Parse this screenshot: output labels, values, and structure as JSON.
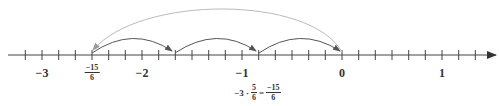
{
  "chart_data": {
    "type": "number-line",
    "title": "",
    "axis": {
      "min": -3.1667,
      "max": 1.3333,
      "tick_step": "1/6",
      "direction_arrow": "right"
    },
    "labels": [
      {
        "value": -3,
        "text": "−3"
      },
      {
        "value": -2.5,
        "text_num": "−15",
        "text_den": "6"
      },
      {
        "value": -2,
        "text": "−2"
      },
      {
        "value": -1,
        "text": "−1"
      },
      {
        "value": 0,
        "text": "0"
      },
      {
        "value": 1,
        "text": "1"
      }
    ],
    "jumps": [
      {
        "from": -2.5,
        "to": -1.6667,
        "color": "#555555"
      },
      {
        "from": -1.6667,
        "to": -0.8333,
        "color": "#555555"
      },
      {
        "from": -0.8333,
        "to": 0,
        "color": "#555555"
      },
      {
        "from": 0,
        "to": -2.5,
        "color": "#bbbbbb"
      }
    ],
    "annotation": {
      "prefix": "−3 ·",
      "frac1_num": "5",
      "frac1_den": "6",
      "equals": "=",
      "frac2_num": "−15",
      "frac2_den": "6"
    },
    "colors": {
      "axis": "#444444",
      "jump": "#555555",
      "return_arc": "#bbbbbb"
    }
  }
}
